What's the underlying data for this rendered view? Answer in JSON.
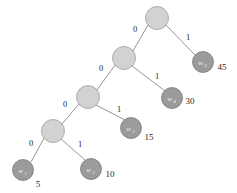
{
  "figure": {
    "type": "huffman-tree",
    "background_color": "#ffffff",
    "internal_node_color": "#d2d2d2",
    "leaf_node_color": "#9b9b9b",
    "edge_color": "#8a8a8a",
    "text_color": "#1f1f1f"
  },
  "nodes": {
    "internal": [
      {
        "id": "root",
        "cx": 157,
        "cy": 18,
        "r": 11.5
      },
      {
        "id": "n2",
        "cx": 124,
        "cy": 58,
        "r": 11.5
      },
      {
        "id": "n3",
        "cx": 88,
        "cy": 97,
        "r": 11.5
      },
      {
        "id": "n4",
        "cx": 53,
        "cy": 131,
        "r": 11.5
      }
    ],
    "leaves": [
      {
        "id": "w5",
        "cx": 203,
        "cy": 62,
        "r": 10.5,
        "label": "w",
        "subscript": "5",
        "weight": "45",
        "weight_x": 222,
        "weight_y": 70
      },
      {
        "id": "w4",
        "cx": 172,
        "cy": 98,
        "r": 10.5,
        "label": "w",
        "subscript": "4",
        "weight": "30",
        "weight_x": 190,
        "weight_y": 104
      },
      {
        "id": "w3",
        "cx": 131,
        "cy": 128,
        "r": 10.5,
        "label": "w",
        "subscript": "3",
        "weight": "15",
        "weight_x": 149,
        "weight_y": 140
      },
      {
        "id": "w2",
        "cx": 91,
        "cy": 169,
        "r": 10.5,
        "label": "w",
        "subscript": "2",
        "weight": "10",
        "weight_x": 110,
        "weight_y": 177
      },
      {
        "id": "w1",
        "cx": 23,
        "cy": 170,
        "r": 10.5,
        "label": "w",
        "subscript": "1",
        "weight": "5",
        "weight_x": 38,
        "weight_y": 187
      }
    ]
  },
  "edges": [
    {
      "id": "root-left",
      "from": "root",
      "to": "n2",
      "x1": 148,
      "y1": 25,
      "x2": 133,
      "y2": 51,
      "label": "0",
      "label_x": 135,
      "label_y": 32
    },
    {
      "id": "root-right",
      "from": "root",
      "to": "w5",
      "x1": 166,
      "y1": 25,
      "x2": 195,
      "y2": 55,
      "label": "1",
      "label_x": 188,
      "label_y": 40
    },
    {
      "id": "n2-left",
      "from": "n2",
      "to": "n3",
      "x1": 115,
      "y1": 65,
      "x2": 97,
      "y2": 90,
      "label": "0",
      "label_x": 101,
      "label_y": 71
    },
    {
      "id": "n2-right",
      "from": "n2",
      "to": "w4",
      "x1": 132,
      "y1": 66,
      "x2": 165,
      "y2": 91,
      "label": "1",
      "label_x": 157,
      "label_y": 79
    },
    {
      "id": "n3-left",
      "from": "n3",
      "to": "n4",
      "x1": 79,
      "y1": 104,
      "x2": 62,
      "y2": 124,
      "label": "0",
      "label_x": 65,
      "label_y": 107
    },
    {
      "id": "n3-right",
      "from": "n3",
      "to": "w3",
      "x1": 96,
      "y1": 105,
      "x2": 125,
      "y2": 120,
      "label": "1",
      "label_x": 119,
      "label_y": 112
    },
    {
      "id": "n4-left",
      "from": "n4",
      "to": "w1",
      "x1": 44,
      "y1": 138,
      "x2": 31,
      "y2": 162,
      "label": "0",
      "label_x": 31,
      "label_y": 146
    },
    {
      "id": "n4-right",
      "from": "n4",
      "to": "w2",
      "x1": 61,
      "y1": 139,
      "x2": 85,
      "y2": 160,
      "label": "1",
      "label_x": 80,
      "label_y": 147
    }
  ],
  "chart_data": {
    "type": "diagram",
    "title": "",
    "tree": {
      "structure": "right-skewed binary Huffman tree",
      "edge_labels": {
        "left": "0",
        "right": "1"
      },
      "codes": [
        {
          "symbol": "w1",
          "weight": 5,
          "code": "0000"
        },
        {
          "symbol": "w2",
          "weight": 10,
          "code": "0001"
        },
        {
          "symbol": "w3",
          "weight": 15,
          "code": "001"
        },
        {
          "symbol": "w4",
          "weight": 30,
          "code": "01"
        },
        {
          "symbol": "w5",
          "weight": 45,
          "code": "1"
        }
      ]
    },
    "weights": [
      5,
      10,
      15,
      30,
      45
    ],
    "symbols": [
      "w1",
      "w2",
      "w3",
      "w4",
      "w5"
    ]
  }
}
